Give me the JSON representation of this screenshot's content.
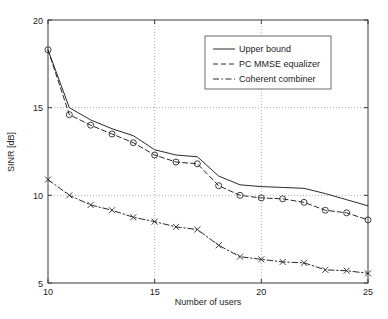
{
  "chart_data": {
    "type": "line",
    "title": "",
    "xlabel": "Number of users",
    "ylabel": "SINR [dB]",
    "xlim": [
      10,
      25
    ],
    "ylim": [
      5,
      20
    ],
    "xticks": [
      10,
      15,
      20,
      25
    ],
    "yticks": [
      5,
      10,
      15,
      20
    ],
    "xtick_labels": [
      "10",
      "15",
      "20",
      "25"
    ],
    "ytick_labels": [
      "5",
      "10",
      "15",
      "20"
    ],
    "grid": true,
    "grid_style": "dotted",
    "legend_position": "upper right",
    "x": [
      10,
      11,
      12,
      13,
      14,
      15,
      16,
      17,
      18,
      19,
      20,
      21,
      22,
      23,
      24,
      25
    ],
    "series": [
      {
        "name": "Upper bound",
        "style": "solid",
        "marker": "none",
        "color": "#2a2a2a",
        "values": [
          18.3,
          15.0,
          14.3,
          13.8,
          13.4,
          12.6,
          12.3,
          12.2,
          11.1,
          10.6,
          10.5,
          10.45,
          10.4,
          10.1,
          9.75,
          9.4
        ]
      },
      {
        "name": "PC MMSE equalizer",
        "style": "dashed",
        "marker": "circle",
        "color": "#2a2a2a",
        "values": [
          18.3,
          14.6,
          14.0,
          13.5,
          13.0,
          12.3,
          11.9,
          11.8,
          10.55,
          10.0,
          9.85,
          9.8,
          9.6,
          9.15,
          9.0,
          8.6
        ]
      },
      {
        "name": "Coherent combiner",
        "style": "dashdot",
        "marker": "cross",
        "color": "#2a2a2a",
        "values": [
          10.9,
          10.0,
          9.45,
          9.15,
          8.75,
          8.5,
          8.2,
          8.05,
          7.15,
          6.5,
          6.35,
          6.2,
          6.15,
          5.75,
          5.7,
          5.55
        ]
      }
    ]
  },
  "legend": {
    "items": [
      {
        "label": "Upper bound"
      },
      {
        "label": "PC MMSE equalizer"
      },
      {
        "label": "Coherent combiner"
      }
    ]
  }
}
